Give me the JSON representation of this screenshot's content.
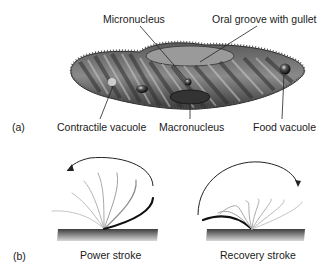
{
  "figure": {
    "panel_a": {
      "label": "(a)",
      "subject": "paramecium",
      "labels": {
        "micronucleus": "Micronucleus",
        "oral_groove": "Oral groove with gullet",
        "contractile_vacuole": "Contractile vacuole",
        "macronucleus": "Macronucleus",
        "food_vacuole": "Food vacuole"
      }
    },
    "panel_b": {
      "label": "(b)",
      "power_stroke": "Power stroke",
      "recovery_stroke": "Recovery stroke"
    }
  },
  "colors": {
    "body_dark": "#3a3a3a",
    "body_mid": "#7a7a7a",
    "body_light": "#c8c8c8",
    "leader_line": "#222222",
    "cilia_faint": "#b0b0b0",
    "cilia_dark": "#111111"
  }
}
